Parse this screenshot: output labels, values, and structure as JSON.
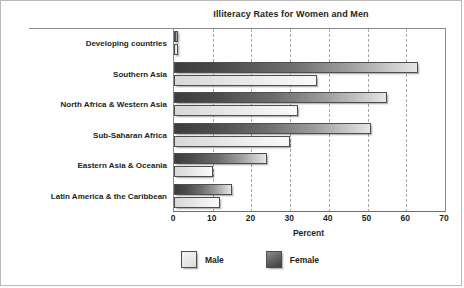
{
  "chart_data": {
    "type": "bar",
    "orientation": "horizontal",
    "title": "Illiteracy Rates for Women and Men",
    "xlabel": "Percent",
    "ylabel": "",
    "xlim": [
      0,
      70
    ],
    "xticks": [
      0,
      10,
      20,
      30,
      40,
      50,
      60,
      70
    ],
    "grid": "vertical-dashed",
    "legend_position": "bottom-center",
    "categories": [
      "Developing countries",
      "Southern Asia",
      "North Africa & Western Asia",
      "Sub-Saharan Africa",
      "Eastern Asia & Oceania",
      "Latin America & the Caribbean"
    ],
    "series": [
      {
        "name": "Female",
        "color": "#4a4a4a",
        "values": [
          1,
          63,
          55,
          51,
          24,
          15
        ]
      },
      {
        "name": "Male",
        "color": "#ebebeb",
        "values": [
          1,
          37,
          32,
          30,
          10,
          12
        ]
      }
    ]
  },
  "legend": {
    "items": [
      {
        "label": "Male",
        "swatch": "male"
      },
      {
        "label": "Female",
        "swatch": "female"
      }
    ]
  }
}
